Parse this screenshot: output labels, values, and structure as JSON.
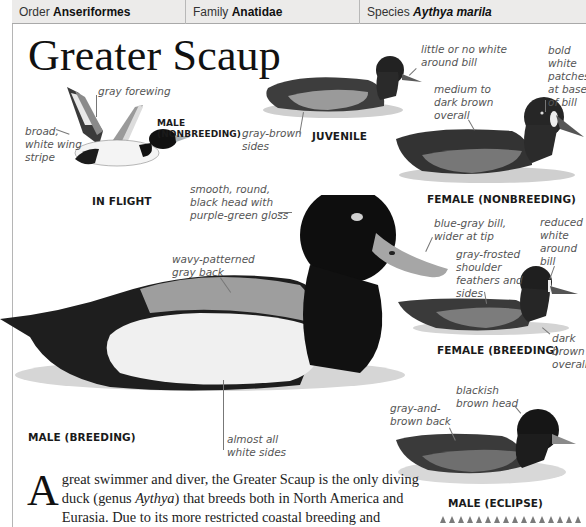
{
  "header": {
    "order_label": "Order",
    "order_value": "Anseriformes",
    "family_label": "Family",
    "family_value": "Anatidae",
    "species_label": "Species",
    "species_value": "Aythya marila"
  },
  "title": "Greater Scaup",
  "figures": {
    "in_flight": {
      "caption": "IN FLIGHT",
      "sub_caption_1": "MALE",
      "sub_caption_2": "(NONBREEDING)",
      "labels": [
        "gray forewing",
        "broad, white wing stripe"
      ]
    },
    "juvenile": {
      "caption": "JUVENILE",
      "labels": [
        "little or no white around bill",
        "gray-brown sides"
      ]
    },
    "female_nonbreeding": {
      "caption": "FEMALE (NONBREEDING)",
      "labels": [
        "medium to dark brown overall",
        "bold white patches at base of bill"
      ]
    },
    "male_breeding": {
      "caption": "MALE (BREEDING)",
      "labels": [
        "smooth, round, black head with purple-green gloss",
        "wavy-patterned gray back",
        "almost all white sides",
        "blue-gray bill, wider at tip"
      ]
    },
    "female_breeding": {
      "caption": "FEMALE (BREEDING)",
      "labels": [
        "gray-frosted shoulder feathers and sides",
        "reduced white around bill",
        "dark brown overall"
      ]
    },
    "male_eclipse": {
      "caption": "MALE (ECLIPSE)",
      "labels": [
        "blackish brown head",
        "gray-and-brown back"
      ]
    }
  },
  "text": {
    "dropcap": "A",
    "line1": " great swimmer and diver, the Greater Scaup is the only diving",
    "line2_a": "duck (genus ",
    "line2_genus": "Aythya",
    "line2_b": ") that breeds both in North America and",
    "line3": "Eurasia. Due to its more restricted coastal breeding and wintering"
  }
}
